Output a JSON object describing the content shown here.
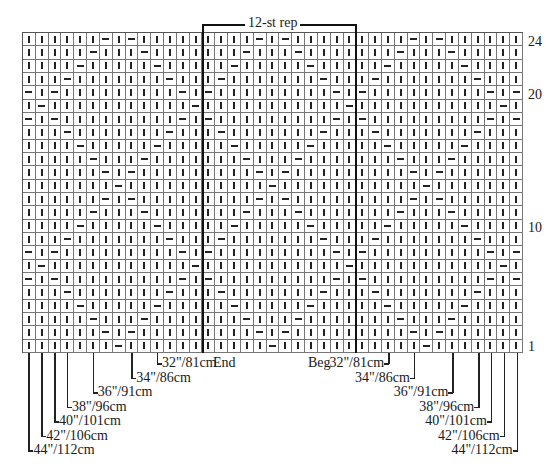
{
  "chart_title": "12-st rep",
  "grid": {
    "columns": 39,
    "rows": 24,
    "legend": {
      "knit": "|",
      "purl": "-"
    },
    "row_strings_top_to_bottom": [
      "||||||-|-|||||||||-|-|||||||||-|-||||||",
      "|||||-|||-|||||||-|||-|||||||-|||-|||||",
      "||||-|||||-|||||-|||||-|||||-|||||-||||",
      "|||-|||||||-|||-|||||||-|||-|||||||-|||",
      "-|-|||||||||-|-|||||||||-|-|||||||||-|-",
      "|-|||||||||||-|||||||||||-|||||||||||-|",
      "-|-|||||||||-|-|||||||||-|-|||||||||-|-",
      "|||-|||||||-|||-|||||||-|||-|||||||-|||",
      "||||-|||||-|||||-|||||-|||||-|||||-||||",
      "|||||-|||-|||||||-|||-|||||||-|||-|||||",
      "||||||-|-|||||||||-|-|||||||||-|-||||||",
      "|||||||-|||||||||||-|||||||||||-|||||||",
      "||||||-|-|||||||||-|-|||||||||-|-||||||",
      "|||||-|||-|||||||-|||-|||||||-|||-|||||",
      "||||-|||||-|||||-|||||-|||||-|||||-||||",
      "|||-|||||||-|||-|||||||-|||-|||||||-|||",
      "-|-|||||||||-|-|||||||||-|-|||||||||-|-",
      "|-|||||||||||-|||||||||||-|||||||||||-|",
      "-|-|||||||||-|-|||||||||-|-|||||||||-|-",
      "|||-|||||||-|||-|||||||-|||-|||||||-|||",
      "||||-|||||-|||||-|||||-|||||-|||||-||||",
      "|||||-|||-|||||||-|||-|||||||-|||-|||||",
      "||||||-|-|||||||||-|-|||||||||-|-||||||",
      "|||||||-|||||||||||-|||||||||||-|||||||"
    ]
  },
  "repeat": {
    "label": "12-st rep",
    "start_col": 15,
    "end_col": 26,
    "end_label": "End",
    "beg_label": "Beg"
  },
  "row_labels": [
    {
      "row": 24,
      "text": "24"
    },
    {
      "row": 20,
      "text": "20"
    },
    {
      "row": 10,
      "text": "10"
    },
    {
      "row": 1,
      "text": "1"
    }
  ],
  "sizes_left": [
    {
      "col": 11,
      "text": "32\"/81cm"
    },
    {
      "col": 9,
      "text": "34\"/86cm"
    },
    {
      "col": 6,
      "text": "36\"/91cm"
    },
    {
      "col": 4,
      "text": "38\"/96cm"
    },
    {
      "col": 3,
      "text": "40\"/101cm"
    },
    {
      "col": 2,
      "text": "42\"/106cm"
    },
    {
      "col": 1,
      "text": "44\"/112cm"
    }
  ],
  "sizes_right": [
    {
      "col": 29,
      "text": "32\"/81cm"
    },
    {
      "col": 31,
      "text": "34\"/86cm"
    },
    {
      "col": 34,
      "text": "36\"/91cm"
    },
    {
      "col": 36,
      "text": "38\"/96cm"
    },
    {
      "col": 37,
      "text": "40\"/101cm"
    },
    {
      "col": 38,
      "text": "42\"/106cm"
    },
    {
      "col": 39,
      "text": "44\"/112cm"
    }
  ]
}
